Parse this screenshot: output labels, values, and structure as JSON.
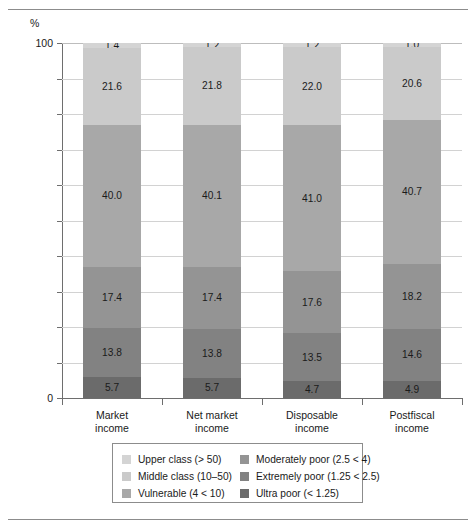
{
  "figure": {
    "unit_label": "%",
    "y_axis": {
      "labels": [
        "100",
        "0"
      ],
      "min": 0,
      "max": 100,
      "tick_step": 10
    }
  },
  "chart_data": {
    "type": "bar",
    "title": "",
    "subtitle": "",
    "xlabel": "",
    "ylabel": "%",
    "ylim": [
      0,
      100
    ],
    "grid": true,
    "stacked": true,
    "stack_total": 100,
    "legend_position": "bottom",
    "y_ticks": [
      0,
      10,
      20,
      30,
      40,
      50,
      60,
      70,
      80,
      90,
      100
    ],
    "y_tick_labels": [
      "0",
      "",
      "",
      "",
      "",
      "",
      "",
      "",
      "",
      "",
      "100"
    ],
    "categories": [
      "Market income",
      "Net market income",
      "Disposable income",
      "Postfiscal income"
    ],
    "category_lines": [
      [
        "Market",
        "income"
      ],
      [
        "Net market",
        "income"
      ],
      [
        "Disposable",
        "income"
      ],
      [
        "Postfiscal",
        "income"
      ]
    ],
    "series": [
      {
        "name": "Upper class (> 50)",
        "color": "#d4d4d4",
        "values": [
          1.4,
          1.2,
          1.2,
          1.0
        ]
      },
      {
        "name": "Middle class (10–50)",
        "color": "#cacaca",
        "values": [
          21.6,
          21.8,
          22.0,
          20.6
        ]
      },
      {
        "name": "Vulnerable (4 < 10)",
        "color": "#a8a8a8",
        "values": [
          40.0,
          40.1,
          41.0,
          40.7
        ]
      },
      {
        "name": "Moderately poor (2.5 < 4)",
        "color": "#949494",
        "values": [
          17.4,
          17.4,
          17.6,
          18.2
        ]
      },
      {
        "name": "Extremely poor (1.25 < 2.5)",
        "color": "#828282",
        "values": [
          13.8,
          13.8,
          13.5,
          14.6
        ]
      },
      {
        "name": "Ultra poor (< 1.25)",
        "color": "#6b6b6b",
        "values": [
          5.7,
          5.7,
          4.7,
          4.9
        ]
      }
    ]
  },
  "legend": {
    "left_column": [
      {
        "label": "Upper class (> 50)",
        "color": "#d4d4d4"
      },
      {
        "label": "Middle class (10–50)",
        "color": "#cacaca"
      },
      {
        "label": "Vulnerable (4 < 10)",
        "color": "#a8a8a8"
      }
    ],
    "right_column": [
      {
        "label": "Moderately poor (2.5 < 4)",
        "color": "#949494"
      },
      {
        "label": "Extremely poor (1.25 < 2.5)",
        "color": "#828282"
      },
      {
        "label": "Ultra poor (< 1.25)",
        "color": "#6b6b6b"
      }
    ]
  }
}
